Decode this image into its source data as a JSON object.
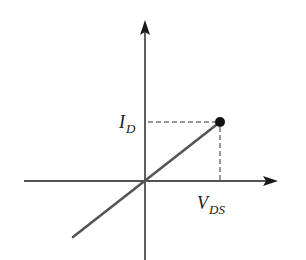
{
  "diagram": {
    "type": "iv-characteristic",
    "axes": {
      "x_label": {
        "main": "V",
        "sub": "DS"
      },
      "y_label": {
        "main": "I",
        "sub": "D"
      }
    },
    "colors": {
      "axis": "#1a1a1a",
      "line": "#555555",
      "dashed": "#333333",
      "point": "#111111",
      "background": "#ffffff"
    },
    "geometry": {
      "origin": [
        145,
        181
      ],
      "x_axis": {
        "start": 24,
        "end": 278
      },
      "y_axis": {
        "top": 20,
        "bottom": 260
      },
      "line": {
        "from": [
          73,
          237
        ],
        "to": [
          220,
          122
        ]
      },
      "point": {
        "cx": 220,
        "cy": 122,
        "r": 5
      }
    },
    "annotations": [
      {
        "text": "I_D",
        "position": "left of y-axis at point height"
      },
      {
        "text": "V_DS",
        "position": "below x-axis at point x"
      }
    ]
  }
}
